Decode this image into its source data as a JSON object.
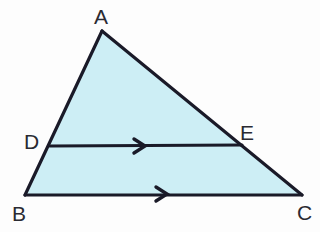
{
  "figure": {
    "type": "geometry-diagram",
    "shape_name": "triangle",
    "background_color": "#fdfdfd",
    "fill_color": "#cdeef5",
    "stroke_color": "#1a1a28",
    "stroke_width": 3,
    "label_color": "#2a2a32"
  },
  "labels": {
    "a": "A",
    "b": "B",
    "c": "C",
    "d": "D",
    "e": "E"
  },
  "points": {
    "A": {
      "x": 102,
      "y": 31
    },
    "B": {
      "x": 25,
      "y": 195
    },
    "C": {
      "x": 302,
      "y": 195
    },
    "D": {
      "x": 50,
      "y": 146
    },
    "E": {
      "x": 242,
      "y": 145
    }
  },
  "label_positions": {
    "A": {
      "x": 94,
      "y": 6
    },
    "B": {
      "x": 12,
      "y": 203
    },
    "C": {
      "x": 297,
      "y": 202
    },
    "D": {
      "x": 24,
      "y": 131
    },
    "E": {
      "x": 240,
      "y": 122
    }
  },
  "segments": {
    "AB": {
      "from": "A",
      "to": "B"
    },
    "AC": {
      "from": "A",
      "to": "C"
    },
    "BC": {
      "from": "B",
      "to": "C"
    },
    "DE": {
      "from": "D",
      "to": "E"
    }
  },
  "parallel_marks": {
    "de_arrow": {
      "x": 140,
      "y": 146,
      "count": 1
    },
    "bc_arrow": {
      "x": 162,
      "y": 194,
      "count": 1
    }
  },
  "paths": {
    "triangle_fill": "M 102 31 L 302 195 L 25 195 Z",
    "side_ab": "M 102 31 L 25 195",
    "side_ac": "M 102 31 L 302 195",
    "side_bc": "M 25 195 L 302 195",
    "segment_de": "M 50 146 L 242 145",
    "arrow_de": "M 134 139 L 145 146 L 134 153",
    "arrow_bc": "M 156 187 L 167 194 L 156 201"
  }
}
